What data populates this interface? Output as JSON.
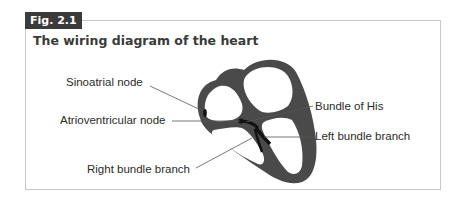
{
  "figure": {
    "tag": "Fig. 2.1",
    "title": "The wiring diagram of the heart"
  },
  "labels": {
    "sinoatrial_node": "Sinoatrial node",
    "atrioventricular_node": "Atrioventricular node",
    "right_bundle_branch": "Right bundle branch",
    "bundle_of_his": "Bundle of His",
    "left_bundle_branch": "Left bundle branch"
  },
  "colors": {
    "tag_bg": "#3b3b3b",
    "heart_wall": "#4a4a4a",
    "frame_border": "#c8c8c8"
  }
}
